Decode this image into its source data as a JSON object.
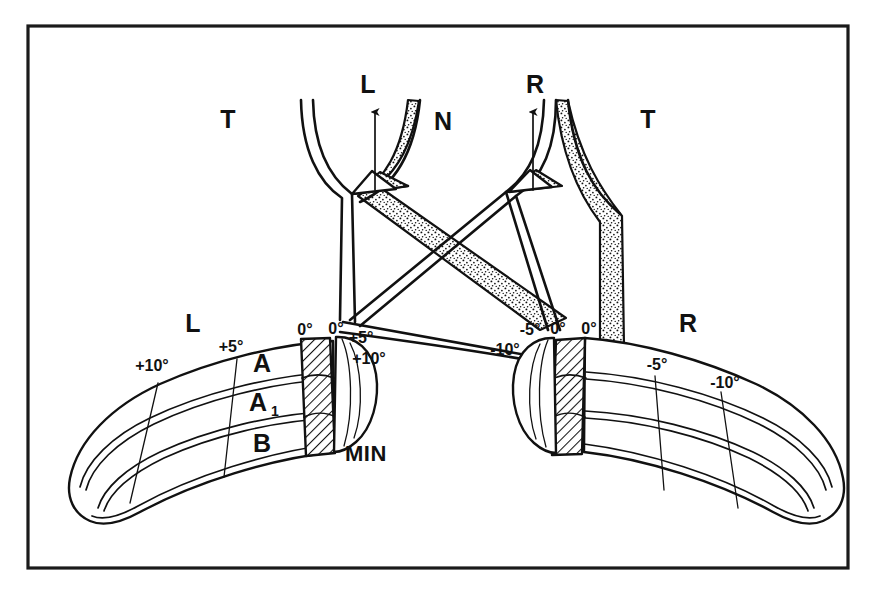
{
  "figure": {
    "background_color": "#ffffff",
    "ink_color": "#111111",
    "frame": {
      "stroke_color": "#1a1a1a",
      "x": 28,
      "y": 26,
      "width": 820,
      "height": 542
    }
  },
  "chiasm": {
    "left_tract_label": "L",
    "right_tract_label": "R",
    "nasal_label": "N",
    "temporal_left_label": "T",
    "temporal_right_label": "T",
    "left_arrow_name": "left-tract-arrow",
    "right_arrow_name": "right-tract-arrow",
    "crossing_note": "decussating nasal fibers shown stippled"
  },
  "retina_left": {
    "side_label": "L",
    "min_label": "MIN",
    "bands": [
      {
        "id": "A",
        "label": "A"
      },
      {
        "id": "A1",
        "label": "A",
        "subscript": "1"
      },
      {
        "id": "B",
        "label": "B"
      }
    ],
    "degree_marks": [
      {
        "label": "+10°",
        "x": 152,
        "y": 371
      },
      {
        "label": "+5°",
        "x": 216,
        "y": 356
      },
      {
        "label": "0°",
        "x": 298,
        "y": 335
      },
      {
        "label": "0°",
        "x": 327,
        "y": 334
      },
      {
        "label": "+5°",
        "x": 349,
        "y": 341
      },
      {
        "label": "+10°",
        "x": 352,
        "y": 364
      }
    ]
  },
  "retina_right": {
    "side_label": "R",
    "degree_marks": [
      {
        "label": "-5°",
        "x": 522,
        "y": 334
      },
      {
        "label": "0°",
        "x": 551,
        "y": 333
      },
      {
        "label": "0°",
        "x": 583,
        "y": 333
      },
      {
        "label": "-10°",
        "x": 494,
        "y": 354
      },
      {
        "label": "-5°",
        "x": 650,
        "y": 370
      },
      {
        "label": "-10°",
        "x": 714,
        "y": 388
      }
    ]
  }
}
